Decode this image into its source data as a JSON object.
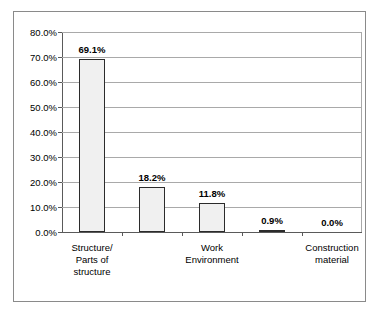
{
  "chart_data": {
    "type": "bar",
    "title": "",
    "subtitle": "",
    "xlabel": "",
    "ylabel": "",
    "categories": [
      "Structure/\nParts of\nstructure",
      "",
      "Work\nEnvironment",
      "",
      "Construction\nmaterial"
    ],
    "category_lines": [
      [
        "Structure/",
        "Parts of",
        "structure"
      ],
      [],
      [
        "Work",
        "Environment"
      ],
      [],
      [
        "Construction",
        "material"
      ]
    ],
    "values": [
      69.1,
      18.2,
      11.8,
      0.9,
      0.0
    ],
    "value_labels": [
      "69.1%",
      "18.2%",
      "11.8%",
      "0.9%",
      "0.0%"
    ],
    "ylim": [
      0,
      80
    ],
    "y_tick_values": [
      0,
      10,
      20,
      30,
      40,
      50,
      60,
      70,
      80
    ],
    "y_tick_labels": [
      "0.0%",
      "10.0%",
      "20.0%",
      "30.0%",
      "40.0%",
      "50.0%",
      "60.0%",
      "70.0%",
      "80.0%"
    ],
    "grid": true,
    "legend": false,
    "legend_position": "none",
    "bar_fill_color": "#f0f0f0",
    "bar_border_color": "#2b2b2b",
    "gridline_color": "#a9a9a9",
    "axis_color": "#5a5a5a",
    "frame_border_color": "#8a8a8a",
    "background_color": "#ffffff",
    "text_color": "#000000"
  }
}
